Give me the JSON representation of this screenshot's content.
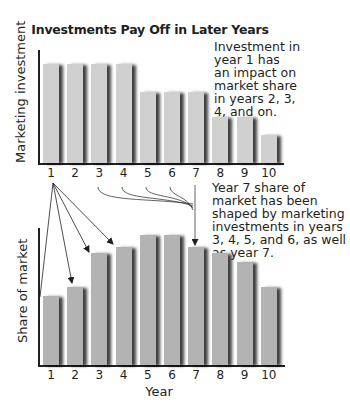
{
  "chart_data": [
    {
      "type": "bar",
      "title": "Investments Pay Off in Later Years",
      "xlabel": "",
      "ylabel": "Marketing investment",
      "categories": [
        "1",
        "2",
        "3",
        "4",
        "5",
        "6",
        "7",
        "8",
        "9",
        "10"
      ],
      "values": [
        100,
        100,
        100,
        100,
        72,
        72,
        72,
        46,
        46,
        28
      ],
      "value_units": "relative height (% of max, no numeric axis shown)",
      "grid": false,
      "annotation": "Investment in year 1 has an impact on market share in years 2, 3, 4, and on."
    },
    {
      "type": "bar",
      "title": "",
      "xlabel": "Year",
      "ylabel": "Share of market",
      "categories": [
        "1",
        "2",
        "3",
        "4",
        "5",
        "6",
        "7",
        "8",
        "9",
        "10"
      ],
      "values": [
        53,
        60,
        86,
        91,
        100,
        100,
        91,
        86,
        79,
        60
      ],
      "value_units": "relative height (% of max, no numeric axis shown)",
      "grid": false,
      "annotation": "Year 7 share of market has been shaped by marketing investments in years 3, 4, 5, and 6, as well as year 7."
    }
  ],
  "title": "Investments Pay Off in Later Years",
  "top": {
    "ylabel": "Marketing investment",
    "note": "Investment in\nyear 1 has\nan impact on\nmarket share\nin years 2, 3,\n4, and on.",
    "ticks": [
      "1",
      "2",
      "3",
      "4",
      "5",
      "6",
      "7",
      "8",
      "9",
      "10"
    ]
  },
  "middle": {
    "note": "Year 7 share of\nmarket has been\nshaped by marketing\ninvestments in years\n3, 4, 5, and 6, as well\nas year 7."
  },
  "bottom": {
    "ylabel": "Share of market",
    "xlabel": "Year",
    "ticks": [
      "1",
      "2",
      "3",
      "4",
      "5",
      "6",
      "7",
      "8",
      "9",
      "10"
    ]
  },
  "colors": {
    "top_bar": "#d0d0d0",
    "bottom_bar": "#b3b3b3",
    "shadow": "#231f20",
    "axis": "#231f20"
  }
}
